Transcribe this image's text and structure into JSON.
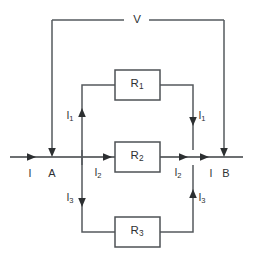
{
  "figure": {
    "type": "circuit-diagram",
    "background_color": "#ffffff",
    "wire_color": "#555a5e",
    "label_color": "#2e3133"
  },
  "source": {
    "label": "V",
    "description": "voltage source label on top wire"
  },
  "nodes": [
    {
      "id": "A",
      "label": "A",
      "x": 52,
      "y": 157
    },
    {
      "id": "B",
      "label": "B",
      "x": 226,
      "y": 157
    }
  ],
  "resistors": [
    {
      "id": "R1",
      "label": "R",
      "subscript": "1",
      "branch": "top",
      "x": 137,
      "y": 79
    },
    {
      "id": "R2",
      "label": "R",
      "subscript": "2",
      "branch": "middle",
      "x": 137,
      "y": 157
    },
    {
      "id": "R3",
      "label": "R",
      "subscript": "3",
      "branch": "bottom",
      "x": 137,
      "y": 232
    }
  ],
  "currents": [
    {
      "id": "I-in",
      "label": "I",
      "subscript": "",
      "x": 30,
      "y": 173,
      "direction": "right"
    },
    {
      "id": "I-out",
      "label": "I",
      "subscript": "",
      "x": 211,
      "y": 173,
      "direction": "right"
    },
    {
      "id": "I1-left",
      "label": "I",
      "subscript": "1",
      "x": 70,
      "y": 116,
      "direction": "up"
    },
    {
      "id": "I1-right",
      "label": "I",
      "subscript": "1",
      "x": 200,
      "y": 116,
      "direction": "down"
    },
    {
      "id": "I2-left",
      "label": "I",
      "subscript": "2",
      "x": 98,
      "y": 173,
      "direction": "right"
    },
    {
      "id": "I2-right",
      "label": "I",
      "subscript": "2",
      "x": 178,
      "y": 173,
      "direction": "right"
    },
    {
      "id": "I3-left",
      "label": "I",
      "subscript": "3",
      "x": 70,
      "y": 198,
      "direction": "down"
    },
    {
      "id": "I3-right",
      "label": "I",
      "subscript": "3",
      "x": 200,
      "y": 198,
      "direction": "up"
    }
  ]
}
